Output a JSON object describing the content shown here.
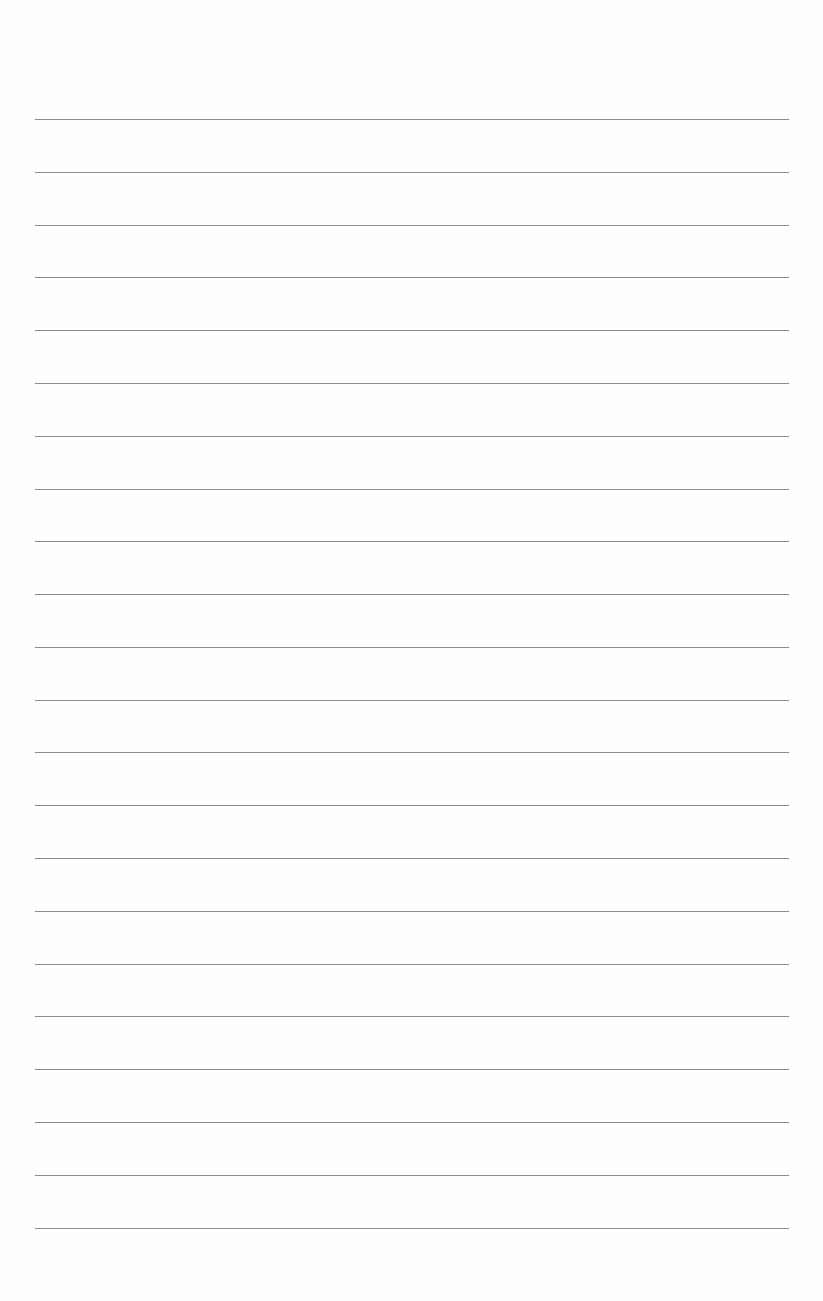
{
  "page": {
    "type": "lined-paper",
    "background_color": "#fefefe",
    "line_color": "#8c8c8c",
    "line_count": 22,
    "line_left": 35,
    "line_right": 789,
    "lines": [
      {
        "y": 119
      },
      {
        "y": 172
      },
      {
        "y": 225
      },
      {
        "y": 277
      },
      {
        "y": 330
      },
      {
        "y": 383
      },
      {
        "y": 436
      },
      {
        "y": 489
      },
      {
        "y": 541
      },
      {
        "y": 594
      },
      {
        "y": 647
      },
      {
        "y": 700
      },
      {
        "y": 752
      },
      {
        "y": 805
      },
      {
        "y": 858
      },
      {
        "y": 911
      },
      {
        "y": 964
      },
      {
        "y": 1016
      },
      {
        "y": 1069
      },
      {
        "y": 1122
      },
      {
        "y": 1175
      },
      {
        "y": 1228
      }
    ]
  }
}
